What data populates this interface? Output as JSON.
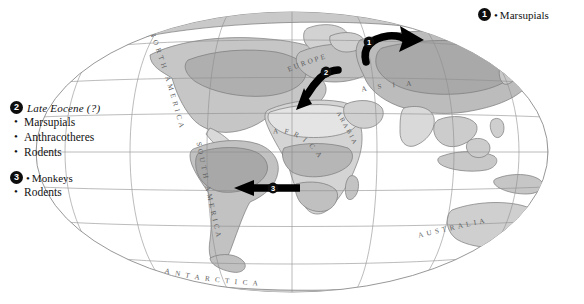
{
  "figure": {
    "type": "paleogeographic-dispersal-map",
    "projection": "oval world map (Mollweide-like)",
    "background_color": "#ffffff",
    "graticule_color": "#8c8c8c",
    "land_outline_color": "#7a7a7a",
    "arrow_color": "#000000",
    "badge_color": "#0d0d0d",
    "badge_text_color": "#ffffff",
    "shading": {
      "land_light": "#eeeeee",
      "land_mid": "#d7d7d7",
      "land_dark": "#bdbdbd",
      "land_darker": "#ababab"
    }
  },
  "legends": {
    "top_right": {
      "number": "1",
      "items": [
        "Marsupials"
      ]
    },
    "left": {
      "group_two": {
        "number": "2",
        "title": "Late Eocene (?)",
        "items": [
          "Marsupials",
          "Anthracotheres",
          "Rodents"
        ]
      },
      "group_three": {
        "number": "3",
        "items": [
          "Monkeys",
          "Rodents"
        ]
      }
    }
  },
  "arrows": [
    {
      "number": "1",
      "label": "1",
      "description": "curved arrow across northern Atlantic into northern Asia, pointing right",
      "direction": "east"
    },
    {
      "number": "2",
      "label": "2",
      "description": "curved arrow from Europe/western Asia pointing down-left toward Africa",
      "direction": "southwest"
    },
    {
      "number": "3",
      "label": "3",
      "description": "straight arrow from Africa pointing left toward South America",
      "direction": "west"
    }
  ],
  "map_labels": [
    {
      "name": "north-america",
      "text": "NORTH AMERICA"
    },
    {
      "name": "south-america",
      "text": "SOUTH AMERICA"
    },
    {
      "name": "europe",
      "text": "EUROPE"
    },
    {
      "name": "asia",
      "text": "ASIA"
    },
    {
      "name": "africa",
      "text": "AFRICA"
    },
    {
      "name": "arabia",
      "text": "ARABIA"
    },
    {
      "name": "australia",
      "text": "AUSTRALIA"
    },
    {
      "name": "antarctica",
      "text": "ANTARCTICA"
    }
  ]
}
